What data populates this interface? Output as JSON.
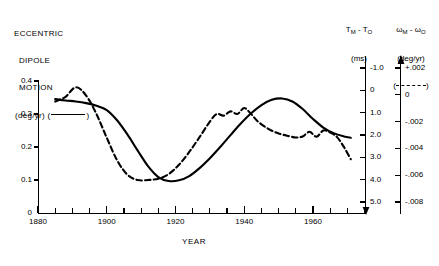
{
  "legend_left": {
    "line1": "ECCENTRIC",
    "line2": "DIPOLE",
    "line3": "MOTION",
    "line4_prefix": "(deg/yr)",
    "line4_open": "(",
    "line4_close": ")",
    "line_style": "solid"
  },
  "header_right": {
    "col1_title_a": "T",
    "col1_title_sub_a": "M",
    "col1_title_b": " - T",
    "col1_title_sub_b": "O",
    "col1_units": "(ms)",
    "col2_title_a": "ω",
    "col2_title_sub_a": "M",
    "col2_title_b": " - ω",
    "col2_title_sub_b": "O",
    "col2_units": "(deg/yr)",
    "legend_open": "(",
    "legend_close": ")",
    "legend_style": "dashed"
  },
  "axes": {
    "x_label": "YEAR",
    "x_ticks_major": [
      "1880",
      "1900",
      "1920",
      "1940",
      "1960"
    ],
    "x_minor_step_years": 5,
    "x_min": 1880,
    "x_max": 1976,
    "y_left_ticks": [
      "0.4",
      "0.3",
      "0.2",
      "0.1",
      "0"
    ],
    "y_left_min": 0,
    "y_left_max": 0.4,
    "y_right1_ticks": [
      "-1.0",
      "0",
      "1.0",
      "2.0",
      "3.0",
      "4.0",
      "5.0"
    ],
    "y_right1_direction": "down-arrow",
    "y_right2_ticks": [
      "+.002",
      "0",
      "-.002",
      "-.004",
      "-.006",
      "-.008"
    ],
    "y_right2_direction": "up-arrow"
  },
  "chart_data": {
    "type": "line",
    "title": "",
    "xlabel": "YEAR",
    "ylabel": "ECCENTRIC DIPOLE MOTION (deg/yr)",
    "xlim": [
      1880,
      1976
    ],
    "ylim": [
      0,
      0.4
    ],
    "grid": false,
    "legend_position": "outside-top",
    "secondary_axes": [
      {
        "name": "T_M - T_O",
        "units": "ms",
        "ticks": [
          -1.0,
          0,
          1.0,
          2.0,
          3.0,
          4.0,
          5.0
        ],
        "inverted": true
      },
      {
        "name": "omega_M - omega_O",
        "units": "deg/yr",
        "ticks": [
          0.002,
          0,
          -0.002,
          -0.004,
          -0.006,
          -0.008
        ],
        "inverted": false
      }
    ],
    "series": [
      {
        "name": "ECCENTRIC DIPOLE MOTION (deg/yr)",
        "style": "solid",
        "color": "#000000",
        "x": [
          1885,
          1888,
          1891,
          1894,
          1897,
          1900,
          1903,
          1906,
          1909,
          1912,
          1915,
          1918,
          1921,
          1924,
          1927,
          1930,
          1933,
          1936,
          1939,
          1942,
          1945,
          1948,
          1951,
          1954,
          1957,
          1960,
          1963,
          1966,
          1969,
          1971
        ],
        "y": [
          0.345,
          0.341,
          0.338,
          0.333,
          0.325,
          0.312,
          0.281,
          0.238,
          0.189,
          0.142,
          0.109,
          0.097,
          0.099,
          0.112,
          0.136,
          0.166,
          0.2,
          0.236,
          0.271,
          0.302,
          0.327,
          0.343,
          0.347,
          0.338,
          0.315,
          0.285,
          0.259,
          0.242,
          0.232,
          0.228
        ]
      },
      {
        "name": "T_M - T_O / omega_M - omega_O",
        "style": "dashed",
        "color": "#000000",
        "x": [
          1885,
          1888,
          1891,
          1894,
          1897,
          1900,
          1903,
          1906,
          1909,
          1912,
          1915,
          1918,
          1921,
          1924,
          1927,
          1930,
          1932,
          1934,
          1936,
          1938,
          1940,
          1942,
          1944,
          1947,
          1950,
          1953,
          1955,
          1957,
          1959,
          1961,
          1963,
          1965,
          1967,
          1969,
          1971
        ],
        "y": [
          0.338,
          0.352,
          0.381,
          0.356,
          0.3,
          0.228,
          0.16,
          0.116,
          0.1,
          0.1,
          0.104,
          0.118,
          0.146,
          0.185,
          0.23,
          0.277,
          0.3,
          0.295,
          0.308,
          0.3,
          0.318,
          0.3,
          0.277,
          0.255,
          0.241,
          0.233,
          0.229,
          0.232,
          0.246,
          0.231,
          0.25,
          0.244,
          0.23,
          0.2,
          0.163
        ]
      }
    ]
  }
}
